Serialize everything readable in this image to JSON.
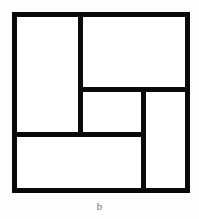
{
  "figure": {
    "caption": "b",
    "stroke_color": "#0a0a0a",
    "fill_color": "#ffffff",
    "background_color": "#fdfdfd",
    "caption_color": "#6d6d6d",
    "stroke_width": 5,
    "frame": {
      "x": 14.5,
      "y": 14.5,
      "width": 173,
      "height": 176
    },
    "regions": [
      {
        "name": "left-tall-rectangle",
        "x": 17,
        "y": 17,
        "width": 61,
        "height": 117
      },
      {
        "name": "top-right-wide-rectangle",
        "x": 83,
        "y": 17,
        "width": 105,
        "height": 72
      },
      {
        "name": "center-small-rectangle",
        "x": 83,
        "y": 92,
        "width": 58,
        "height": 42
      },
      {
        "name": "right-tall-rectangle",
        "x": 146,
        "y": 92,
        "width": 42,
        "height": 99
      },
      {
        "name": "bottom-wide-rectangle",
        "x": 17,
        "y": 137,
        "width": 124,
        "height": 54
      }
    ],
    "dividers": [
      {
        "name": "left-vertical-divider",
        "orientation": "vertical",
        "x": 80.5,
        "y1": 14.5,
        "y2": 134.5
      },
      {
        "name": "upper-horizontal-divider",
        "orientation": "horizontal",
        "y": 89.5,
        "x1": 80.5,
        "x2": 190.5
      },
      {
        "name": "lower-horizontal-divider",
        "orientation": "horizontal",
        "y": 134.5,
        "x1": 12.5,
        "x2": 143.5
      },
      {
        "name": "right-vertical-divider",
        "orientation": "vertical",
        "x": 143.5,
        "y1": 89.5,
        "y2": 190.5
      }
    ]
  }
}
